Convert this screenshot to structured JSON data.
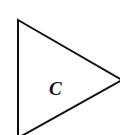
{
  "diagram": {
    "shape": "triangle",
    "label": "C",
    "stroke_color": "#111111",
    "fill_color": "#ffffff"
  }
}
